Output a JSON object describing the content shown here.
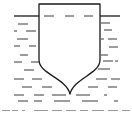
{
  "figure": {
    "type": "diagram",
    "colors": {
      "stroke": "#1a1a1a",
      "water_dash": "#3a3a3a",
      "caption": "#9a9a9a",
      "background": "#ffffff"
    },
    "vessel": {
      "top_y": 4,
      "left_x": 39,
      "right_x": 100,
      "straight_side_bottom_y": 60,
      "keel_point": [
        70,
        94
      ]
    },
    "water_surface": {
      "y": 16,
      "left_start_x": 14,
      "right_end_x": 120
    },
    "water_dashes": [
      [
        44,
        16,
        54,
        16
      ],
      [
        65,
        16,
        74,
        16
      ],
      [
        84,
        16,
        93,
        16
      ],
      [
        18,
        24,
        28,
        24
      ],
      [
        101,
        23,
        110,
        23
      ],
      [
        14,
        31,
        17,
        31
      ],
      [
        26,
        31,
        36,
        31
      ],
      [
        104,
        30,
        112,
        30
      ],
      [
        17,
        39,
        28,
        39
      ],
      [
        101,
        39,
        104,
        39
      ],
      [
        108,
        39,
        117,
        39
      ],
      [
        14,
        46,
        20,
        46
      ],
      [
        29,
        46,
        36,
        46
      ],
      [
        109,
        47,
        118,
        47
      ],
      [
        20,
        55,
        28,
        55
      ],
      [
        101,
        55,
        108,
        55
      ],
      [
        14,
        62,
        22,
        62
      ],
      [
        31,
        62,
        39,
        62
      ],
      [
        103,
        61,
        113,
        61
      ],
      [
        115,
        61,
        118,
        61
      ],
      [
        24,
        70,
        34,
        70
      ],
      [
        98,
        69,
        110,
        69
      ],
      [
        14,
        79,
        24,
        79
      ],
      [
        32,
        79,
        42,
        79
      ],
      [
        96,
        79,
        107,
        79
      ],
      [
        111,
        79,
        120,
        79
      ],
      [
        22,
        87,
        32,
        87
      ],
      [
        42,
        87,
        52,
        87
      ],
      [
        88,
        87,
        98,
        87
      ],
      [
        108,
        87,
        117,
        87
      ],
      [
        14,
        95,
        24,
        95
      ],
      [
        34,
        95,
        44,
        95
      ],
      [
        52,
        95,
        66,
        95
      ],
      [
        76,
        95,
        90,
        95
      ],
      [
        104,
        95,
        107,
        95
      ],
      [
        18,
        101,
        28,
        101
      ],
      [
        34,
        101,
        42,
        101
      ],
      [
        54,
        101,
        70,
        101
      ],
      [
        82,
        101,
        98,
        101
      ],
      [
        114,
        101,
        118,
        101
      ]
    ]
  },
  "caption": {
    "legible": false,
    "marks": [
      [
        2,
        8
      ],
      [
        12,
        6
      ],
      [
        22,
        3
      ],
      [
        34,
        14
      ],
      [
        52,
        10
      ],
      [
        66,
        10
      ],
      [
        80,
        8
      ],
      [
        92,
        12
      ],
      [
        108,
        10
      ],
      [
        122,
        8
      ]
    ]
  }
}
